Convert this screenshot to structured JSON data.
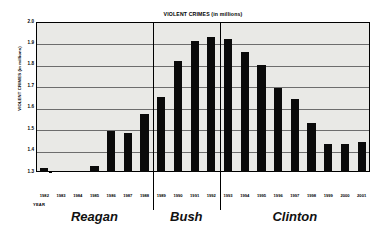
{
  "chart_data": {
    "type": "bar",
    "title": "VIOLENT CRIMES (in millions)",
    "xlabel": "YEAR",
    "ylabel": "VIOLENT CRIMES (in millions)",
    "ylim": [
      1.3,
      2.0
    ],
    "ytick_step": 0.1,
    "ytick_labels": [
      "2.0",
      "1.9",
      "1.8",
      "1.7",
      "1.6",
      "1.5",
      "1.4",
      "1.3"
    ],
    "grid": true,
    "legend": "none",
    "bar_color": "#0a0a0a",
    "plot_background": "#e9e9e6",
    "categories": [
      "1982",
      "1983",
      "1984",
      "1985",
      "1986",
      "1987",
      "1988",
      "1989",
      "1990",
      "1991",
      "1992",
      "1993",
      "1994",
      "1995",
      "1996",
      "1997",
      "1998",
      "1999",
      "2000",
      "2001"
    ],
    "values": [
      1.32,
      1.26,
      1.27,
      1.33,
      1.49,
      1.48,
      1.57,
      1.65,
      1.82,
      1.91,
      1.93,
      1.92,
      1.86,
      1.8,
      1.69,
      1.64,
      1.53,
      1.43,
      1.43,
      1.44
    ],
    "annotations": [
      {
        "label": "Reagan",
        "start_year": "1982",
        "end_year": "1988"
      },
      {
        "label": "Bush",
        "start_year": "1989",
        "end_year": "1992"
      },
      {
        "label": "Clinton",
        "start_year": "1993",
        "end_year": "2001"
      }
    ]
  },
  "eras": [
    {
      "name": "Reagan"
    },
    {
      "name": "Bush"
    },
    {
      "name": "Clinton"
    }
  ]
}
